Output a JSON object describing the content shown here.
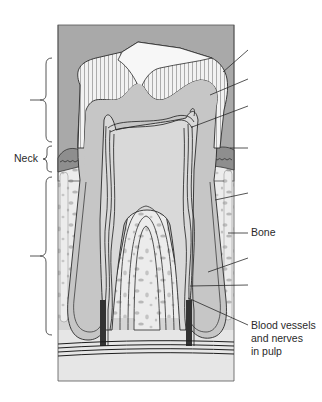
{
  "diagram": {
    "colors": {
      "background_gray": "#a9a9a9",
      "enamel": "#f2f2f2",
      "dentin": "#c6c6c6",
      "pulp": "#d9d9d9",
      "bone": "#ececec",
      "bone_spots": "#bdbdbd",
      "gum": "#8e8e8e",
      "outline": "#2a2a2a"
    },
    "left_labels": {
      "neck": "Neck"
    },
    "right_labels": {
      "bone": "Bone",
      "pulp_vessels": "Blood vessels\nand nerves\nin pulp"
    },
    "brackets": [
      {
        "name": "crown-bracket",
        "label": "",
        "y_top": 58,
        "y_bottom": 142
      },
      {
        "name": "neck-bracket",
        "label": "Neck",
        "y_top": 146,
        "y_bottom": 172
      },
      {
        "name": "root-bracket",
        "label": "",
        "y_top": 177,
        "y_bottom": 335
      }
    ],
    "leader_lines": [
      {
        "name": "leader-enamel",
        "label": ""
      },
      {
        "name": "leader-dentin",
        "label": ""
      },
      {
        "name": "leader-pulp-cavity",
        "label": ""
      },
      {
        "name": "leader-gum",
        "label": ""
      },
      {
        "name": "leader-root-dentin",
        "label": ""
      },
      {
        "name": "leader-bone",
        "label": "Bone"
      },
      {
        "name": "leader-cementum",
        "label": ""
      },
      {
        "name": "leader-periodontal-ligament",
        "label": ""
      },
      {
        "name": "leader-blood-vessels",
        "label": "Blood vessels and nerves in pulp"
      }
    ]
  }
}
